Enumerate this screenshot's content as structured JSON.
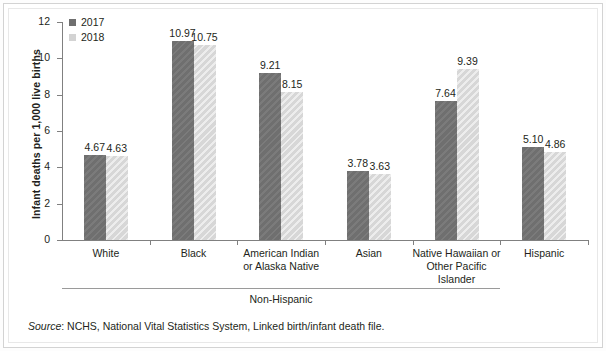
{
  "chart_data": {
    "type": "bar",
    "title": "",
    "xlabel": "",
    "ylabel": "Infant deaths per 1,000 live births",
    "ylim": [
      0,
      12
    ],
    "yticks": [
      0,
      2,
      4,
      6,
      8,
      10,
      12
    ],
    "grid": false,
    "legend_position": "top-left",
    "categories": [
      "White",
      "Black",
      "American Indian or Alaska Native",
      "Asian",
      "Native Hawaiian or Other Pacific Islander",
      "Hispanic"
    ],
    "category_lines": [
      [
        "White"
      ],
      [
        "Black"
      ],
      [
        "American Indian",
        "or Alaska Native"
      ],
      [
        "Asian"
      ],
      [
        "Native Hawaiian or",
        "Other Pacific Islander"
      ],
      [
        "Hispanic"
      ]
    ],
    "series": [
      {
        "name": "2017",
        "color": "#6f6f6f",
        "values": [
          4.67,
          10.97,
          9.21,
          3.78,
          7.64,
          5.1
        ]
      },
      {
        "name": "2018",
        "color": "#d7d7d7",
        "values": [
          4.63,
          10.75,
          8.15,
          3.63,
          9.39,
          4.86
        ]
      }
    ],
    "value_labels": [
      [
        "4.67",
        "4.63"
      ],
      [
        "10.97",
        "10.75"
      ],
      [
        "9.21",
        "8.15"
      ],
      [
        "3.78",
        "3.63"
      ],
      [
        "7.64",
        "9.39"
      ],
      [
        "5.10",
        "4.86"
      ]
    ],
    "group_bracket": {
      "label": "Non-Hispanic",
      "covers": [
        "White",
        "Black",
        "American Indian or Alaska Native",
        "Asian",
        "Native Hawaiian or Other Pacific Islander"
      ]
    },
    "annotations": {
      "source_prefix": "Source",
      "source_text": ": NCHS, National Vital Statistics System, Linked birth/infant death file."
    }
  },
  "legend": {
    "items": [
      {
        "label": "2017",
        "swatch": "legend-swatch-2017"
      },
      {
        "label": "2018",
        "swatch": "legend-swatch-2018"
      }
    ]
  },
  "axis": {
    "y_tick_labels": [
      "12",
      "10",
      "8",
      "6",
      "4",
      "2",
      "0"
    ],
    "y_title": "Infant deaths per 1,000 live births"
  },
  "colors": {
    "series_2017": "#6f6f6f",
    "series_2018": "#d7d7d7",
    "axis": "#808080",
    "text": "#231f20",
    "frame": "#d3d3d3"
  }
}
